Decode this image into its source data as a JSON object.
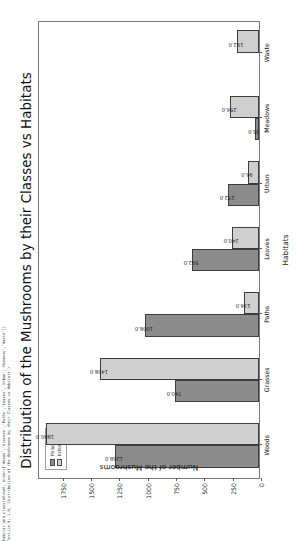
{
  "code_strip": {
    "lines": [
      "habitat_and_class(df=mdf, order=['Woods','Grasses','Paths','Leaves','Urban','Meadows','Waste'])",
      "Textile.9, 1.8, 'Distribution of the Mushrooms by their Classes vs Habitats')"
    ]
  },
  "chart_data": {
    "type": "bar",
    "title": "Distribution of the Mushrooms by their Classes vs Habitats",
    "xlabel": "Habitats",
    "ylabel": "Number of the Mushrooms",
    "categories": [
      "Woods",
      "Grasses",
      "Paths",
      "Leaves",
      "Urban",
      "Meadows",
      "Waste"
    ],
    "series": [
      {
        "name": "Poisonous",
        "color": "#8c8c8c",
        "values": [
          1268.0,
          740.0,
          1008.0,
          592.0,
          272.0,
          36.0,
          0.0
        ],
        "labels": [
          "1268.0",
          "740.0",
          "1008.0",
          "592.0",
          "272.0",
          "36.0",
          ""
        ]
      },
      {
        "name": "Edible",
        "color": "#cfcfcf",
        "values": [
          1880.0,
          1408.0,
          136.0,
          240.0,
          96.0,
          256.0,
          192.0
        ],
        "labels": [
          "1880.0",
          "1408.0",
          "136.0",
          "240.0",
          "96.0",
          "256.0",
          "192.0"
        ]
      }
    ],
    "ylim": [
      0,
      1960
    ],
    "yticks": [
      0,
      250,
      500,
      750,
      1000,
      1250,
      1500,
      1750
    ],
    "ytick_labels": [
      "0",
      "250",
      "500",
      "750",
      "1000",
      "1250",
      "1500",
      "1750"
    ],
    "grid": false,
    "legend_position": "upper right",
    "bar_edge_color": "#3d3d3d",
    "background": "#ffffff"
  }
}
